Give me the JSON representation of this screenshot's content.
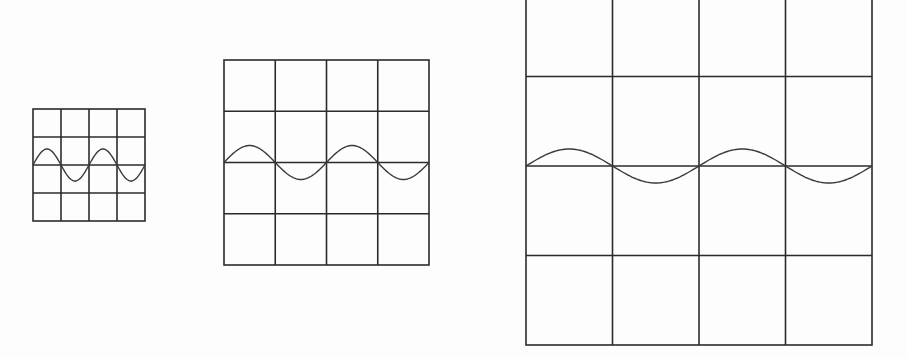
{
  "figure": {
    "line_color": "#2b2b2b",
    "wave_color": "#3a3a3a",
    "background": "#fdfdfd"
  },
  "screens": [
    {
      "id": "small",
      "x": 33,
      "y": 109,
      "width": 112,
      "height": 112,
      "cols": 4,
      "rows": 4,
      "wave": {
        "center_y": 165,
        "amplitude": 16,
        "half_cycle_px": 28,
        "cycles": 2,
        "start_phase": "up"
      }
    },
    {
      "id": "medium",
      "x": 224,
      "y": 60,
      "width": 205,
      "height": 205,
      "cols": 4,
      "rows": 4,
      "wave": {
        "center_y": 162.5,
        "amplitude": 17,
        "half_cycle_px": 51.25,
        "cycles": 2,
        "start_phase": "up"
      }
    },
    {
      "id": "large",
      "x": 526,
      "y": -13,
      "width": 346,
      "height": 358,
      "cols": 4,
      "rows": 4,
      "wave": {
        "center_y": 166,
        "amplitude": 17,
        "half_cycle_px": 86.5,
        "cycles": 2,
        "start_phase": "up"
      }
    }
  ]
}
